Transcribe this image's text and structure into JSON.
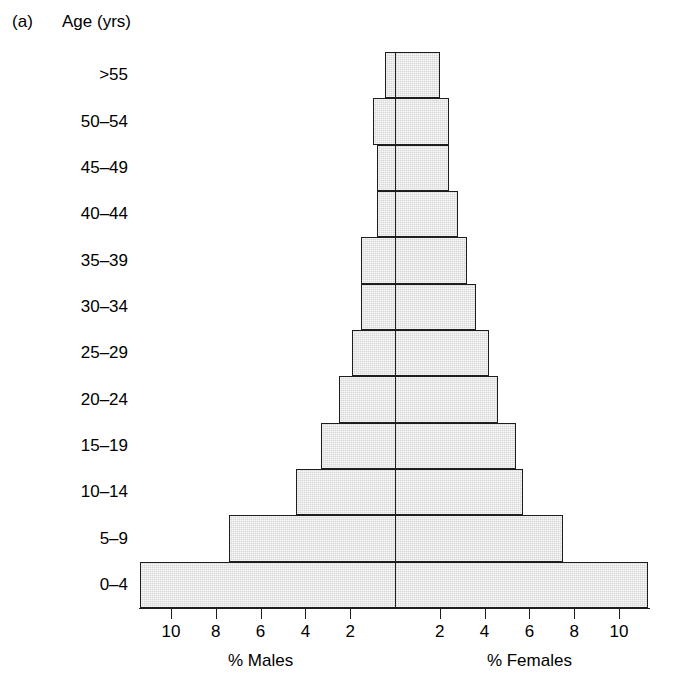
{
  "panel": {
    "label": "(a)"
  },
  "axis": {
    "y_title": "Age (yrs)",
    "left_title": "% Males",
    "right_title": "% Females",
    "tick_labels_left": [
      "10",
      "8",
      "6",
      "4",
      "2"
    ],
    "tick_labels_right": [
      "2",
      "4",
      "6",
      "8",
      "10"
    ]
  },
  "chart_data": {
    "type": "bar",
    "subtype": "population-pyramid",
    "title": "",
    "xlabel_left": "% Males",
    "xlabel_right": "% Females",
    "ylabel": "Age (yrs)",
    "categories": [
      "0–4",
      "5–9",
      "10–14",
      "15–19",
      "20–24",
      "25–29",
      "30–34",
      "35–39",
      "40–44",
      "45–49",
      "50–54",
      ">55"
    ],
    "categories_top_to_bottom": [
      ">55",
      "50–54",
      "45–49",
      "40–44",
      "35–39",
      "30–34",
      "25–29",
      "20–24",
      "15–19",
      "10–14",
      "5–9",
      "0–4"
    ],
    "series": [
      {
        "name": "% Males",
        "values": [
          11.4,
          7.4,
          4.4,
          3.3,
          2.5,
          1.9,
          1.5,
          1.5,
          0.8,
          0.8,
          1.0,
          0.45
        ]
      },
      {
        "name": "% Females",
        "values": [
          11.3,
          7.5,
          5.7,
          5.4,
          4.6,
          4.2,
          3.6,
          3.2,
          2.8,
          2.4,
          2.4,
          2.0
        ]
      }
    ],
    "xlim": [
      -11.7,
      11.7
    ],
    "xticks": [
      10,
      8,
      6,
      4,
      2,
      2,
      4,
      6,
      8,
      10
    ],
    "grid": false,
    "legend": "none",
    "bar_fill": "#d7d7d7",
    "bar_edge": "#1d1d1d"
  }
}
